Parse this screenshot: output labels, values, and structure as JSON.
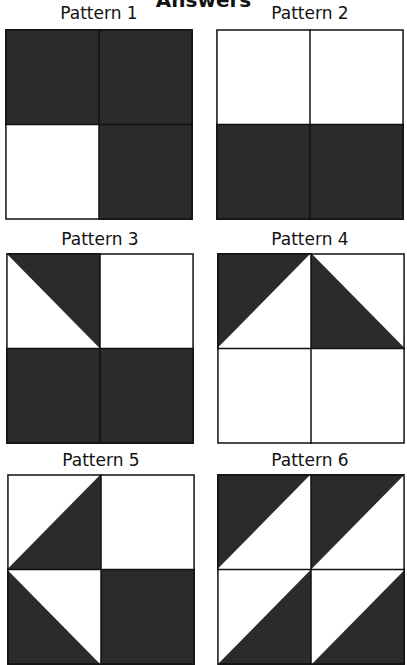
{
  "title": "Answers",
  "colors": {
    "dark": "#2b2b2b",
    "light": "#ffffff",
    "line": "#111111"
  },
  "patterns": [
    {
      "label": "Pattern 1",
      "cells": [
        "dark",
        "dark",
        "light",
        "dark"
      ]
    },
    {
      "label": "Pattern 2",
      "cells": [
        "light",
        "light",
        "dark",
        "dark"
      ]
    },
    {
      "label": "Pattern 3",
      "cells": [
        "tri-tr",
        "light",
        "dark",
        "dark"
      ]
    },
    {
      "label": "Pattern 4",
      "cells": [
        "tri-tl",
        "tri-bl",
        "light",
        "light"
      ]
    },
    {
      "label": "Pattern 5",
      "cells": [
        "tri-br",
        "light",
        "tri-bl",
        "dark"
      ]
    },
    {
      "label": "Pattern 6",
      "cells": [
        "tri-tl",
        "tri-tl",
        "tri-br",
        "tri-br"
      ]
    }
  ],
  "legend_cell_order": [
    "top-left",
    "top-right",
    "bottom-left",
    "bottom-right"
  ]
}
